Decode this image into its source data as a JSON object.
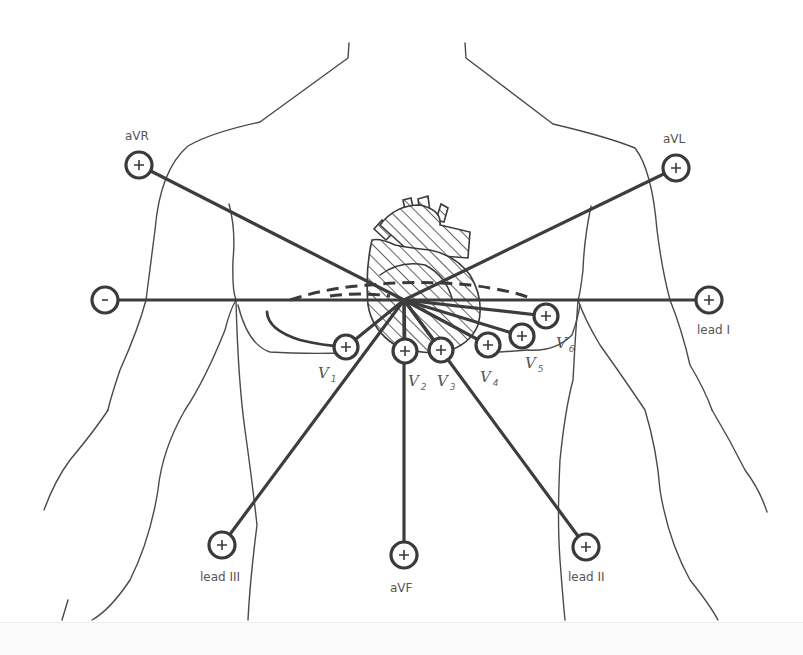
{
  "diagram": {
    "center": {
      "x": 404,
      "y": 300
    },
    "colors": {
      "line": "#3d3d3d",
      "body_outline": "#4a4a4a",
      "label": "#555555",
      "background": "#ffffff"
    },
    "limb_leads": [
      {
        "id": "aVR",
        "label": "aVR",
        "sign": "+",
        "x": 139,
        "y": 165,
        "label_x": 125,
        "label_y": 140
      },
      {
        "id": "aVL",
        "label": "aVL",
        "sign": "+",
        "x": 676,
        "y": 168,
        "label_x": 663,
        "label_y": 143
      },
      {
        "id": "lead-I-neg",
        "label": "",
        "sign": "-",
        "x": 105,
        "y": 300,
        "label_x": 0,
        "label_y": 0
      },
      {
        "id": "lead-I",
        "label": "lead I",
        "sign": "+",
        "x": 709,
        "y": 300,
        "label_x": 697,
        "label_y": 334
      },
      {
        "id": "lead-III",
        "label": "lead III",
        "sign": "+",
        "x": 222,
        "y": 545,
        "label_x": 200,
        "label_y": 581
      },
      {
        "id": "aVF",
        "label": "aVF",
        "sign": "+",
        "x": 404,
        "y": 555,
        "label_x": 390,
        "label_y": 592
      },
      {
        "id": "lead-II",
        "label": "lead II",
        "sign": "+",
        "x": 586,
        "y": 547,
        "label_x": 568,
        "label_y": 581
      }
    ],
    "precordial_leads": [
      {
        "id": "V1",
        "label": "V",
        "sub": "1",
        "x": 346,
        "y": 347,
        "label_x": 318,
        "label_y": 378
      },
      {
        "id": "V2",
        "label": "V",
        "sub": "2",
        "x": 405,
        "y": 351,
        "label_x": 408,
        "label_y": 388
      },
      {
        "id": "V3",
        "label": "V",
        "sub": "3",
        "x": 441,
        "y": 350,
        "label_x": 437,
        "label_y": 388
      },
      {
        "id": "V4",
        "label": "V",
        "sub": "4",
        "x": 488,
        "y": 345,
        "label_x": 480,
        "label_y": 383
      },
      {
        "id": "V5",
        "label": "V",
        "sub": "5",
        "x": 522,
        "y": 336,
        "label_x": 525,
        "label_y": 369
      },
      {
        "id": "V6",
        "label": "V",
        "sub": "6",
        "x": 546,
        "y": 316,
        "label_x": 556,
        "label_y": 352
      }
    ]
  }
}
